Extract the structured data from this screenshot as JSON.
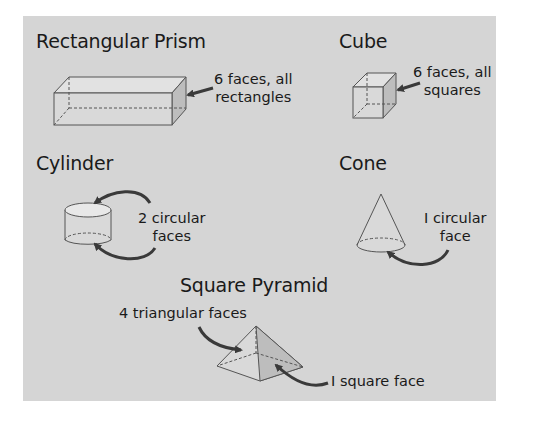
{
  "diagram": {
    "background_color": "#d5d5d5",
    "shapes": [
      {
        "id": "rectangular-prism",
        "title": "Rectangular Prism",
        "label_line1": "6 faces, all",
        "label_line2": "rectangles"
      },
      {
        "id": "cube",
        "title": "Cube",
        "label_line1": "6 faces, all",
        "label_line2": "squares"
      },
      {
        "id": "cylinder",
        "title": "Cylinder",
        "label_line1": "2 circular",
        "label_line2": "faces"
      },
      {
        "id": "cone",
        "title": "Cone",
        "label_line1": "I circular",
        "label_line2": "face"
      },
      {
        "id": "square-pyramid",
        "title": "Square Pyramid",
        "label_line1": "4 triangular faces",
        "label_line2": "I square face"
      }
    ]
  }
}
